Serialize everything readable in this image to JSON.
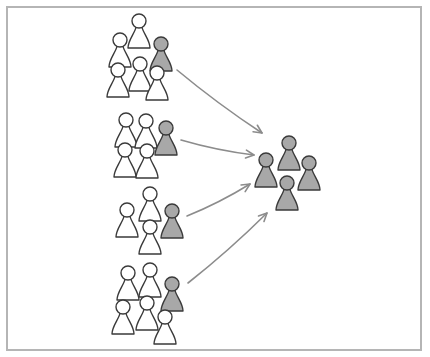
{
  "diagram": {
    "type": "many-to-one-merge",
    "colors": {
      "background": "#ffffff",
      "frame": "#b5b5b5",
      "outline": "#3a3a3a",
      "highlight_fill": "#a8a8a8",
      "plain_fill": "#ffffff",
      "arrow": "#8c8c8c"
    },
    "source_groups": [
      {
        "id": "group-1",
        "people": [
          {
            "x": 139,
            "y": 21,
            "highlighted": false
          },
          {
            "x": 120,
            "y": 40,
            "highlighted": false
          },
          {
            "x": 161,
            "y": 44,
            "highlighted": true
          },
          {
            "x": 140,
            "y": 64,
            "highlighted": false
          },
          {
            "x": 118,
            "y": 70,
            "highlighted": false
          },
          {
            "x": 157,
            "y": 73,
            "highlighted": false
          }
        ]
      },
      {
        "id": "group-2",
        "people": [
          {
            "x": 126,
            "y": 120,
            "highlighted": false
          },
          {
            "x": 146,
            "y": 121,
            "highlighted": false
          },
          {
            "x": 166,
            "y": 128,
            "highlighted": true
          },
          {
            "x": 125,
            "y": 150,
            "highlighted": false
          },
          {
            "x": 147,
            "y": 151,
            "highlighted": false
          }
        ]
      },
      {
        "id": "group-3",
        "people": [
          {
            "x": 150,
            "y": 194,
            "highlighted": false
          },
          {
            "x": 127,
            "y": 210,
            "highlighted": false
          },
          {
            "x": 172,
            "y": 211,
            "highlighted": true
          },
          {
            "x": 150,
            "y": 227,
            "highlighted": false
          }
        ]
      },
      {
        "id": "group-4",
        "people": [
          {
            "x": 128,
            "y": 273,
            "highlighted": false
          },
          {
            "x": 150,
            "y": 270,
            "highlighted": false
          },
          {
            "x": 172,
            "y": 284,
            "highlighted": true
          },
          {
            "x": 123,
            "y": 307,
            "highlighted": false
          },
          {
            "x": 147,
            "y": 303,
            "highlighted": false
          },
          {
            "x": 165,
            "y": 317,
            "highlighted": false
          }
        ]
      }
    ],
    "target_group": {
      "id": "merged-group",
      "people": [
        {
          "x": 289,
          "y": 143,
          "highlighted": true
        },
        {
          "x": 266,
          "y": 160,
          "highlighted": true
        },
        {
          "x": 309,
          "y": 163,
          "highlighted": true
        },
        {
          "x": 287,
          "y": 183,
          "highlighted": true
        }
      ]
    },
    "arrows": [
      {
        "from": [
          177,
          70
        ],
        "to": [
          262,
          133
        ]
      },
      {
        "from": [
          181,
          140
        ],
        "to": [
          254,
          155
        ]
      },
      {
        "from": [
          187,
          216
        ],
        "to": [
          250,
          184
        ]
      },
      {
        "from": [
          188,
          283
        ],
        "to": [
          267,
          213
        ]
      }
    ]
  }
}
